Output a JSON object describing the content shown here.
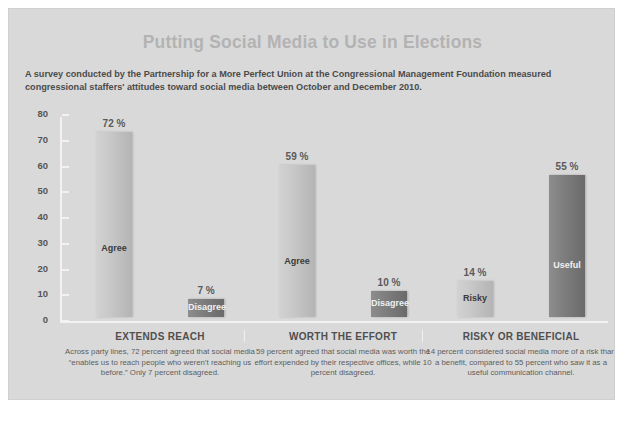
{
  "header": {
    "title": "Putting Social Media to Use in Elections",
    "subtitle": "A survey conducted by the Partnership for a More Perfect Union at the Congressional Management Foundation measured congressional staffers' attitudes toward social media between October and December 2010."
  },
  "chart_data": {
    "type": "bar",
    "title": "Putting Social Media to Use in Elections",
    "xlabel": "",
    "ylabel": "",
    "ylim": [
      0,
      80
    ],
    "yticks": [
      0,
      10,
      20,
      30,
      40,
      50,
      60,
      70,
      80
    ],
    "ytick_labels": [
      "0",
      "10",
      "20",
      "30",
      "40",
      "50",
      "60",
      "70",
      "80"
    ],
    "grid": false,
    "legend": "none",
    "categories": [
      "EXTENDS REACH",
      "WORTH THE EFFORT",
      "RISKY OR BENEFICIAL"
    ],
    "groups": [
      {
        "category": "EXTENDS REACH",
        "caption": "Across party lines, 72 percent agreed that social media “enables us to reach people who weren’t reaching us before.” Only 7 percent disagreed.",
        "bars": [
          {
            "label": "Agree",
            "value": 72,
            "value_label": "72 %",
            "style": "light"
          },
          {
            "label": "Disagree",
            "value": 7,
            "value_label": "7 %",
            "style": "dark"
          }
        ]
      },
      {
        "category": "WORTH THE EFFORT",
        "caption": "59 percent agreed that social media was worth the effort expended by their respective offices, while 10 percent disagreed.",
        "bars": [
          {
            "label": "Agree",
            "value": 59,
            "value_label": "59 %",
            "style": "light"
          },
          {
            "label": "Disagree",
            "value": 10,
            "value_label": "10 %",
            "style": "dark"
          }
        ]
      },
      {
        "category": "RISKY OR BENEFICIAL",
        "caption": "14 percent considered social media more of a risk than a benefit, compared to 55 percent who saw it as a useful communication channel.",
        "bars": [
          {
            "label": "Risky",
            "value": 14,
            "value_label": "14 %",
            "style": "light"
          },
          {
            "label": "Useful",
            "value": 55,
            "value_label": "55 %",
            "style": "dark"
          }
        ]
      }
    ]
  },
  "colors": {
    "panel_background": "#d9d9d9",
    "title": "#b3b3b3",
    "subtitle": "#4b4b4b",
    "axis": "#f2f2f2",
    "bar_light": "#c9c9c9",
    "bar_dark": "#7e7e7e",
    "caption_text": "#5d5d5d"
  }
}
